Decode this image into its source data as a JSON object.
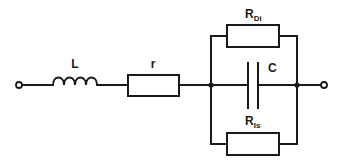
{
  "diagram": {
    "type": "circuit-schematic",
    "colors": {
      "stroke": "#1a1a1a",
      "background": "#ffffff"
    },
    "components": [
      {
        "id": "L",
        "kind": "inductor",
        "label": "L"
      },
      {
        "id": "r",
        "kind": "resistor",
        "label": "r"
      },
      {
        "id": "RDi",
        "kind": "resistor",
        "label_main": "R",
        "label_sub": "Di"
      },
      {
        "id": "C",
        "kind": "capacitor",
        "label": "C"
      },
      {
        "id": "RIs",
        "kind": "resistor",
        "label_main": "R",
        "label_sub": "Is"
      }
    ],
    "terminals": [
      {
        "id": "left-terminal"
      },
      {
        "id": "right-terminal"
      }
    ],
    "connections": [
      "left-terminal -> L -> r -> node-A",
      "node-A -> RDi -> node-B",
      "node-A -> C -> node-B",
      "node-A -> RIs -> node-B",
      "node-B -> right-terminal"
    ]
  },
  "labels": {
    "L": "L",
    "r": "r",
    "RDi_main": "R",
    "RDi_sub": "Di",
    "C": "C",
    "RIs_main": "R",
    "RIs_sub": "Is"
  }
}
